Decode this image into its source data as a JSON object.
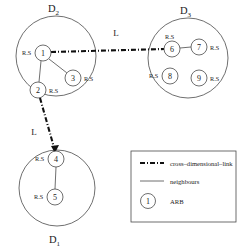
{
  "figure": {
    "title": "",
    "type": "network-diagram",
    "background_color": "#ffffff",
    "stroke_color": "#4a4a4a",
    "link_color": "#111111"
  },
  "dimensions": [
    {
      "id": "D2",
      "label": "D",
      "subscript": "2",
      "label_position": "top",
      "cx": 56,
      "cy": 56,
      "r": 40
    },
    {
      "id": "D3",
      "label": "D",
      "subscript": "3",
      "label_position": "top",
      "cx": 188,
      "cy": 58,
      "r": 40
    },
    {
      "id": "D1",
      "label": "D",
      "subscript": "1",
      "label_position": "bottom",
      "cx": 57,
      "cy": 188,
      "r": 38
    }
  ],
  "nodes": [
    {
      "id": "1",
      "label": "1",
      "dimension": "D2",
      "cx": 43,
      "cy": 53,
      "r": 8,
      "rs_label": "R.S",
      "rs_side": "left"
    },
    {
      "id": "2",
      "label": "2",
      "dimension": "D2",
      "cx": 38,
      "cy": 90,
      "r": 8,
      "rs_label": "R.S",
      "rs_side": "right"
    },
    {
      "id": "3",
      "label": "3",
      "dimension": "D2",
      "cx": 73,
      "cy": 78,
      "r": 8,
      "rs_label": "R.S",
      "rs_side": "right"
    },
    {
      "id": "4",
      "label": "4",
      "dimension": "D1",
      "cx": 56,
      "cy": 159,
      "r": 8,
      "rs_label": "R.S",
      "rs_side": "left"
    },
    {
      "id": "5",
      "label": "5",
      "dimension": "D1",
      "cx": 55,
      "cy": 197,
      "r": 8,
      "rs_label": "R.S",
      "rs_side": "left"
    },
    {
      "id": "6",
      "label": "6",
      "dimension": "D3",
      "cx": 172,
      "cy": 49,
      "r": 8,
      "rs_label": "R.S",
      "rs_side": "top"
    },
    {
      "id": "7",
      "label": "7",
      "dimension": "D3",
      "cx": 199,
      "cy": 47,
      "r": 8,
      "rs_label": "R.S",
      "rs_side": "right"
    },
    {
      "id": "8",
      "label": "8",
      "dimension": "D3",
      "cx": 170,
      "cy": 76,
      "r": 8,
      "rs_label": "R.S",
      "rs_side": "left"
    },
    {
      "id": "9",
      "label": "9",
      "dimension": "D3",
      "cx": 199,
      "cy": 78,
      "r": 8,
      "rs_label": "R.S",
      "rs_side": "right"
    }
  ],
  "neighbour_edges": [
    {
      "from": "1",
      "to": "3"
    },
    {
      "from": "1",
      "to": "2"
    },
    {
      "from": "6",
      "to": "7"
    },
    {
      "from": "4",
      "to": "5"
    }
  ],
  "cross_links": [
    {
      "from": "1",
      "to": "6",
      "label": "L",
      "label_x": 116,
      "label_y": 33
    },
    {
      "from": "2",
      "to": "4",
      "label": "L",
      "label_x": 34,
      "label_y": 132
    }
  ],
  "legend": {
    "box": {
      "x": 131,
      "y": 151,
      "w": 105,
      "h": 71
    },
    "items": [
      {
        "id": "cross-dimensional-link",
        "label": "cross–dimensional–link",
        "symbol": "dash-dot-line"
      },
      {
        "id": "neighbours",
        "label": "neighbours",
        "symbol": "solid-line"
      },
      {
        "id": "arb",
        "label": "ARB",
        "symbol": "numbered-circle",
        "symbol_text": "1"
      }
    ]
  }
}
